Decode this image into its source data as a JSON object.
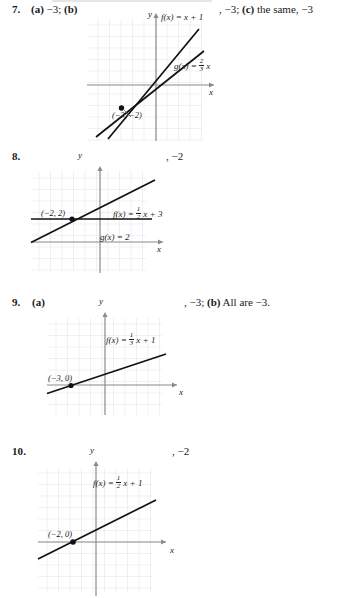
{
  "page": {
    "kind": "textbook-answer-key-excerpt",
    "background": "#ffffff",
    "ink": "#1a1a1a",
    "grid_color": "#dfe3ea",
    "axis_color": "#8a8a8a",
    "curve_color": "#111111"
  },
  "items": [
    {
      "number": "7.",
      "left_text": "(a) −3; (b)",
      "right_text_parts": [
        "",
        ", −3; ",
        "(c)",
        " the same, −3"
      ],
      "right_text": ", −3; (c) the same, −3",
      "graph": {
        "y_axis_label": "y",
        "x_axis_label": "x",
        "curves": [
          {
            "name": "f",
            "label": "f(x) = x + 1",
            "slope": 1,
            "intercept": 1
          },
          {
            "name": "g",
            "label": "g(x) = ⅔x",
            "label_num": "2",
            "label_den": "3",
            "slope": 0.6667,
            "intercept": 0
          }
        ],
        "point": {
          "label": "(−3, −2)",
          "x": -3,
          "y": -2
        }
      }
    },
    {
      "number": "8.",
      "left_text": "",
      "right_text": ", −2",
      "graph": {
        "y_axis_label": "y",
        "x_axis_label": "x",
        "curves": [
          {
            "name": "f",
            "label": "f(x) = ½x + 3",
            "label_num": "1",
            "label_den": "2",
            "slope": 0.5,
            "intercept": 3
          },
          {
            "name": "g",
            "label": "g(x) = 2",
            "slope": 0,
            "intercept": 2
          }
        ],
        "point": {
          "label": "(−2, 2)",
          "x": -2,
          "y": 2
        }
      }
    },
    {
      "number": "9.",
      "left_text": "(a)",
      "right_text": ", −3; (b) All are −3.",
      "graph": {
        "y_axis_label": "y",
        "x_axis_label": "x",
        "curves": [
          {
            "name": "f",
            "label": "f(x) = ⅓x + 1",
            "label_num": "1",
            "label_den": "3",
            "slope": 0.3333,
            "intercept": 1
          }
        ],
        "point": {
          "label": "(−3, 0)",
          "x": -3,
          "y": 0
        }
      }
    },
    {
      "number": "10.",
      "left_text": "",
      "right_text": ", −2",
      "graph": {
        "y_axis_label": "y",
        "x_axis_label": "x",
        "curves": [
          {
            "name": "f",
            "label": "f(x) = ½x + 1",
            "label_num": "1",
            "label_den": "2",
            "slope": 0.5,
            "intercept": 1
          }
        ],
        "point": {
          "label": "(−2, 0)",
          "x": -2,
          "y": 0
        }
      }
    }
  ],
  "labels": {
    "fx_plain_7": "f(x) = x + 1",
    "gx_7_prefix": "g(x) =",
    "gx_7_num": "2",
    "gx_7_den": "3",
    "gx_7_suffix": "x",
    "fx_8_prefix": "f(x) =",
    "fx_8_num": "1",
    "fx_8_den": "2",
    "fx_8_suffix": "x + 3",
    "gx_8": "g(x) = 2",
    "fx_9_prefix": "f(x) =",
    "fx_9_num": "1",
    "fx_9_den": "3",
    "fx_9_suffix": "x + 1",
    "fx_10_prefix": "f(x) =",
    "fx_10_num": "1",
    "fx_10_den": "2",
    "fx_10_suffix": "x + 1",
    "axis_y": "y",
    "axis_x": "x",
    "pt_7": "(−3, −2)",
    "pt_8": "(−2, 2)",
    "pt_9": "(−3, 0)",
    "pt_10": "(−2, 0)"
  },
  "right_texts": {
    "item7_a": ", −3; ",
    "item7_b": "(c)",
    "item7_c": " the same, −3",
    "item8": ", −2",
    "item9_a": ", −3; ",
    "item9_b": "(b)",
    "item9_c": " All are −3.",
    "item10": ", −2"
  },
  "left_texts": {
    "item7_a": "(a)",
    "item7_b": " −3; ",
    "item7_c": "(b)",
    "item9_a": "(a)"
  }
}
